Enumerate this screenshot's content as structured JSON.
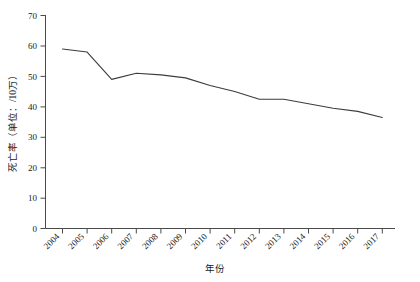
{
  "chart_data": {
    "type": "line",
    "title": "",
    "xlabel": "年份",
    "ylabel": "死亡率（单位：/10万）",
    "categories": [
      "2004",
      "2005",
      "2006",
      "2007",
      "2008",
      "2009",
      "2010",
      "2011",
      "2012",
      "2013",
      "2014",
      "2015",
      "2016",
      "2017"
    ],
    "values": [
      59.0,
      58.0,
      49.0,
      51.0,
      50.5,
      49.5,
      47.0,
      45.0,
      42.5,
      42.5,
      41.0,
      39.5,
      38.5,
      36.5
    ],
    "series": [
      {
        "name": "死亡率",
        "values": [
          59.0,
          58.0,
          49.0,
          51.0,
          50.5,
          49.5,
          47.0,
          45.0,
          42.5,
          42.5,
          41.0,
          39.5,
          38.5,
          36.5
        ]
      }
    ],
    "ylim": [
      0,
      70
    ],
    "yticks": [
      0,
      10,
      20,
      30,
      40,
      50,
      60,
      70
    ],
    "ytick_labels": [
      "0",
      "10",
      "20",
      "30",
      "40",
      "50",
      "60",
      "70"
    ],
    "grid": false,
    "legend": false,
    "legend_position": "none",
    "line_color": "#3c3c3c",
    "axis_color": "#4a4a4a",
    "markers": false,
    "xtick_rotation": 45
  }
}
